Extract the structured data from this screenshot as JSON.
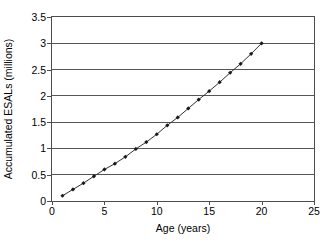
{
  "chart_data": {
    "type": "line",
    "title": "",
    "subtitle": "",
    "xlabel": "Age (years)",
    "ylabel": "Accumulated ESALs (millions)",
    "xlim": [
      0,
      25
    ],
    "ylim": [
      0,
      3.5
    ],
    "xticks": [
      0,
      5,
      10,
      15,
      20,
      25
    ],
    "xtick_labels": [
      "0",
      "5",
      "10",
      "15",
      "20",
      "25"
    ],
    "yticks": [
      0,
      0.5,
      1,
      1.5,
      2,
      2.5,
      3,
      3.5
    ],
    "ytick_labels": [
      "0",
      "0.5",
      "1",
      "1.5",
      "2",
      "2.5",
      "3",
      "3.5"
    ],
    "grid": {
      "horizontal": true,
      "vertical": false,
      "color": "#555555"
    },
    "legend": {
      "visible": false,
      "position": "none",
      "entries": []
    },
    "annotations": [],
    "series": [
      {
        "name": "Accumulated ESALs",
        "line_color": "#333333",
        "marker": "diamond",
        "marker_color": "#1a1a1a",
        "x": [
          1,
          2,
          3,
          4,
          5,
          6,
          7,
          8,
          9,
          10,
          11,
          12,
          13,
          14,
          15,
          16,
          17,
          18,
          19,
          20
        ],
        "values": [
          0.1,
          0.22,
          0.34,
          0.47,
          0.6,
          0.71,
          0.84,
          0.99,
          1.12,
          1.27,
          1.44,
          1.59,
          1.76,
          1.93,
          2.09,
          2.26,
          2.44,
          2.61,
          2.8,
          3.0
        ]
      }
    ]
  },
  "axes": {
    "x_title": "Age (years)",
    "y_title": "Accumulated ESALs (millions)"
  }
}
